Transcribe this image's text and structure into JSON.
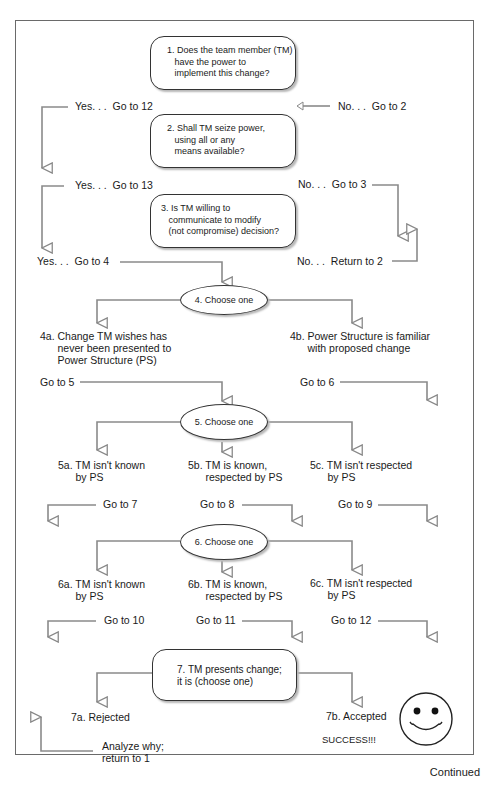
{
  "flowchart": {
    "q1": "1. Does the team member (TM)\n   have the power to\n   implement this change?",
    "q1_yes": "Yes. . .  Go to 12",
    "q1_no": "No. . .  Go to 2",
    "q2": "2. Shall TM seize power,\n   using all or any\n   means available?",
    "q2_yes": "Yes. . .  Go to 13",
    "q2_no": "No. . .  Go to 3",
    "q3": "3. Is TM willing to\n   communicate to modify\n   (not compromise) decision?",
    "q3_yes": "Yes. . .  Go to 4",
    "q3_no": "No. . .  Return to 2",
    "s4": "4. Choose one",
    "s4a": "4a. Change TM wishes has\n      never been presented to\n      Power Structure (PS)",
    "s4b": "4b. Power Structure is familiar\n      with proposed change",
    "s4a_go": "Go to 5",
    "s4b_go": "Go to 6",
    "s5": "5. Choose one",
    "s5a": "5a. TM isn't known\n      by PS",
    "s5b": "5b. TM is known,\n      respected by PS",
    "s5c": "5c. TM isn't respected\n      by PS",
    "s5a_go": "Go to 7",
    "s5b_go": "Go to 8",
    "s5c_go": "Go to 9",
    "s6": "6. Choose one",
    "s6a": "6a. TM isn't known\n      by PS",
    "s6b": "6b. TM is known,\n      respected by PS",
    "s6c": "6c. TM isn't respected\n      by PS",
    "s6a_go": "Go to 10",
    "s6b_go": "Go to 11",
    "s6c_go": "Go to 12",
    "s7": "7. TM presents change;\nit is (choose one)",
    "s7a": "7a. Rejected",
    "s7b": "7b. Accepted",
    "s7a_action": "Analyze why;\nreturn to 1",
    "success": "SUCCESS!!!",
    "smiley_icon": "smiley-face"
  },
  "footer": {
    "continued": "Continued"
  },
  "colors": {
    "line": "#7a7a7a",
    "border": "#333333"
  }
}
